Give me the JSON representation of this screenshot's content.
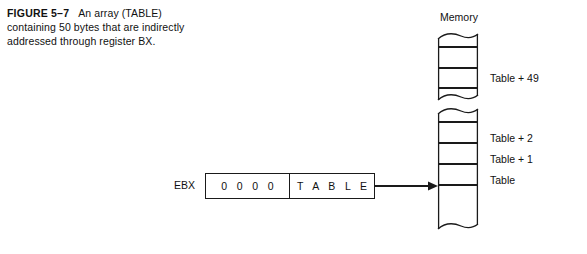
{
  "figure": {
    "label": "FIGURE 5–7",
    "caption": "An array (TABLE) containing 50 bytes that are indirectly addressed through register BX."
  },
  "register": {
    "name": "EBX",
    "high_word": "0 0 0 0",
    "low_word": "T A B L E"
  },
  "memory": {
    "title": "Memory",
    "labels": {
      "table_plus_49": "Table + 49",
      "table_plus_2": "Table + 2",
      "table_plus_1": "Table + 1",
      "table": "Table"
    }
  },
  "colors": {
    "ink": "#1a1a1a",
    "text": "#111111",
    "background": "#ffffff"
  },
  "icons": {
    "pointer_arrow": "arrow-right-icon",
    "torn_edge": "torn-edge-icon"
  }
}
